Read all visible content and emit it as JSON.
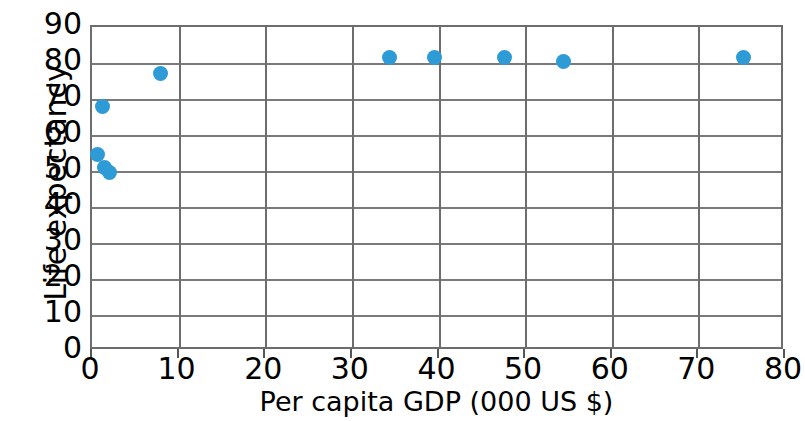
{
  "chart_data": {
    "type": "scatter",
    "title": "",
    "xlabel": "Per capita GDP (000 US $)",
    "ylabel": "Life expectancy",
    "xlim": [
      0,
      80
    ],
    "ylim": [
      0,
      90
    ],
    "xticks": [
      0,
      10,
      20,
      30,
      40,
      50,
      60,
      70,
      80
    ],
    "yticks": [
      0,
      10,
      20,
      30,
      40,
      50,
      60,
      70,
      80,
      90
    ],
    "xtick_labels": [
      "0",
      "10",
      "20",
      "30",
      "40",
      "50",
      "60",
      "70",
      "80"
    ],
    "ytick_labels": [
      "0",
      "10",
      "20",
      "30",
      "40",
      "50",
      "60",
      "70",
      "80",
      "90"
    ],
    "grid": "both",
    "legend": "none",
    "marker_color": "#2e9bd6",
    "grid_color": "#7a7a7a",
    "axis_color": "#6d6d6d",
    "background_color": "#ffffff",
    "points": [
      {
        "x": 0.6,
        "y": 54.5
      },
      {
        "x": 1.2,
        "y": 68.0
      },
      {
        "x": 1.5,
        "y": 51.0
      },
      {
        "x": 2.0,
        "y": 49.5
      },
      {
        "x": 7.9,
        "y": 77.0
      },
      {
        "x": 34.3,
        "y": 81.5
      },
      {
        "x": 39.5,
        "y": 81.5
      },
      {
        "x": 47.6,
        "y": 81.5
      },
      {
        "x": 54.4,
        "y": 80.5
      },
      {
        "x": 75.2,
        "y": 81.5
      }
    ]
  }
}
